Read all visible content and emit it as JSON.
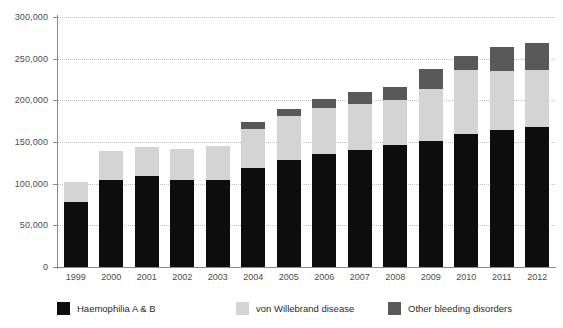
{
  "chart_data": {
    "type": "bar",
    "subtype": "stacked-vertical",
    "title": "",
    "xlabel": "",
    "ylabel": "",
    "ylim": [
      0,
      300000
    ],
    "ytick_values": [
      0,
      50000,
      100000,
      150000,
      200000,
      250000,
      300000
    ],
    "ytick_labels": [
      "0",
      "50,000",
      "100,000",
      "150,000",
      "200,000",
      "250,000",
      "300,000"
    ],
    "grid": true,
    "grid_axis": "y",
    "legend_position": "bottom",
    "categories": [
      "1999",
      "2000",
      "2001",
      "2002",
      "2003",
      "2004",
      "2005",
      "2006",
      "2007",
      "2008",
      "2009",
      "2010",
      "2011",
      "2012"
    ],
    "series": [
      {
        "name": "Haemophilia A & B",
        "color": "#0d0d0d",
        "values": [
          78000,
          105000,
          109000,
          104000,
          104000,
          119000,
          129000,
          136000,
          141000,
          146000,
          151000,
          160000,
          164000,
          168000
        ]
      },
      {
        "name": "von Willebrand disease",
        "color": "#d4d4d4",
        "values": [
          24000,
          34000,
          35000,
          38000,
          41000,
          47000,
          52000,
          55000,
          55000,
          55000,
          63000,
          76000,
          71000,
          68000
        ]
      },
      {
        "name": "Other bleeding disorders",
        "color": "#595959",
        "values": [
          0,
          0,
          0,
          0,
          0,
          8000,
          9000,
          11000,
          14000,
          15000,
          24000,
          17000,
          29000,
          33000
        ]
      }
    ],
    "totals": [
      102000,
      139000,
      144000,
      142000,
      145000,
      174000,
      190000,
      202000,
      210000,
      216000,
      238000,
      253000,
      264000,
      269000
    ]
  },
  "legend": {
    "items": [
      {
        "label": "Haemophilia A & B",
        "color": "#0d0d0d"
      },
      {
        "label": "von Willebrand disease",
        "color": "#d4d4d4"
      },
      {
        "label": "Other bleeding disorders",
        "color": "#595959"
      }
    ]
  }
}
